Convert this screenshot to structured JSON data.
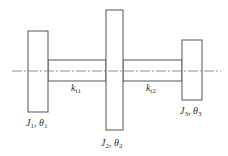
{
  "diagram": {
    "disks": [
      {
        "id": "disk1",
        "J": "J",
        "J_sub": "1",
        "theta": "θ",
        "theta_sub": "1",
        "x": 28,
        "y": 31,
        "w": 20,
        "h": 81,
        "label_x": 27,
        "label_y": 126
      },
      {
        "id": "disk2",
        "J": "J",
        "J_sub": "2",
        "theta": "θ",
        "theta_sub": "2",
        "x": 106,
        "y": 10,
        "w": 17,
        "h": 120,
        "label_x": 101,
        "label_y": 146
      },
      {
        "id": "disk3",
        "J": "J",
        "J_sub": "3",
        "theta": "θ",
        "theta_sub": "3",
        "x": 182,
        "y": 40,
        "w": 20,
        "h": 60,
        "label_x": 180,
        "label_y": 114
      }
    ],
    "shafts": [
      {
        "id": "shaft1",
        "k": "k",
        "k_sub": "t1",
        "x1": 48,
        "x2": 106,
        "y_top": 60,
        "y_bot": 81,
        "label_x": 71,
        "label_y": 91
      },
      {
        "id": "shaft2",
        "k": "k",
        "k_sub": "t2",
        "x1": 123,
        "x2": 182,
        "y_top": 60,
        "y_bot": 81,
        "label_x": 146,
        "label_y": 91
      }
    ],
    "centerline": {
      "x1": 12,
      "x2": 221,
      "y": 71
    },
    "colors": {
      "line": "#555555",
      "centerline": "#777777",
      "text": "#333333"
    }
  },
  "labels": {
    "disk1": {
      "J": "J",
      "J_sub": "1",
      "sep": ", ",
      "theta": "θ",
      "theta_sub": "1"
    },
    "disk2": {
      "J": "J",
      "J_sub": "2",
      "sep": ", ",
      "theta": "θ",
      "theta_sub": "2"
    },
    "disk3": {
      "J": "J",
      "J_sub": "3",
      "sep": ", ",
      "theta": "θ",
      "theta_sub": "3"
    },
    "shaft1": {
      "k": "k",
      "k_sub": "t1"
    },
    "shaft2": {
      "k": "k",
      "k_sub": "t2"
    }
  }
}
